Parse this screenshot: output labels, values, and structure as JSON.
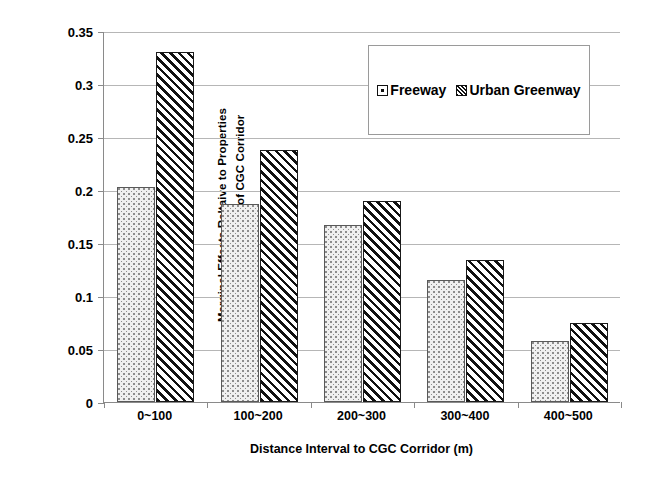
{
  "chart_data": {
    "type": "bar",
    "title": "",
    "subtitle": "",
    "xlabel": "Distance Interval to CGC Corridor (m)",
    "ylabel_line1": "Marginal Effects Reltaive to Properties",
    "ylabel_line2": "Beyond 500 meters of CGC Corridor",
    "ylabel": "Marginal Effects Reltaive to Properties Beyond 500 meters of CGC Corridor",
    "categories": [
      "0~100",
      "100~200",
      "200~300",
      "300~400",
      "400~500"
    ],
    "series": [
      {
        "name": "Freeway",
        "values": [
          0.203,
          0.187,
          0.167,
          0.115,
          0.058
        ],
        "pattern": "dotted",
        "color": "#f0f0f0",
        "edge_color": "#595959"
      },
      {
        "name": "Urban Greenway",
        "values": [
          0.33,
          0.238,
          0.19,
          0.134,
          0.075
        ],
        "pattern": "diagonal-hatch",
        "color": "#ffffff",
        "edge_color": "#111111"
      }
    ],
    "ylim": [
      0,
      0.35
    ],
    "ytick_values": [
      0,
      0.05,
      0.1,
      0.15,
      0.2,
      0.25,
      0.3,
      0.35
    ],
    "ytick_labels": [
      "0",
      "0.05",
      "0.1",
      "0.15",
      "0.2",
      "0.25",
      "0.3",
      "0.35"
    ],
    "grid": "horizontal",
    "legend_position": "upper-right-inside",
    "legend_entries": [
      "Freeway",
      "Urban Greenway"
    ],
    "axis_color": "#8a8a8a",
    "grid_color": "#b6b6b6",
    "background_color": "#ffffff"
  }
}
